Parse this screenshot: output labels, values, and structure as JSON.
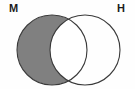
{
  "figure": {
    "kind": "venn-diagram",
    "title": "",
    "background_color": "#fefefe",
    "stroke_color": "#3a3a3a",
    "shade_color": "#808080",
    "unshaded_color": "#ffffff"
  },
  "labels": {
    "left": "M",
    "right": "H"
  },
  "sets": [
    {
      "id": "left-set",
      "label": "M",
      "center_x": 52,
      "center_y": 50,
      "radius": 35,
      "shaded": true,
      "fill": "#808080"
    },
    {
      "id": "right-set",
      "label": "H",
      "center_x": 85,
      "center_y": 50,
      "radius": 35,
      "shaded": false,
      "fill": "#ffffff"
    }
  ],
  "regions": [
    {
      "id": "left-only",
      "name": "M only",
      "shaded": true,
      "fill": "#808080"
    },
    {
      "id": "intersection",
      "name": "M and H",
      "shaded": false,
      "fill": "#ffffff"
    },
    {
      "id": "right-only",
      "name": "H only",
      "shaded": false,
      "fill": "#ffffff"
    }
  ]
}
